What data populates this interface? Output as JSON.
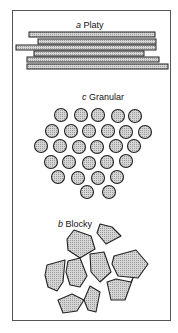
{
  "figure": {
    "panels": [
      {
        "id": "a",
        "letter": "a",
        "name": "Platy"
      },
      {
        "id": "c",
        "letter": "c",
        "name": "Granular"
      },
      {
        "id": "b",
        "letter": "b",
        "name": "Blocky"
      }
    ]
  },
  "colors": {
    "stroke": "#222222",
    "fill": "#c8c8c8",
    "frame": "#555555"
  }
}
